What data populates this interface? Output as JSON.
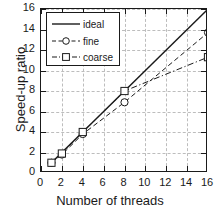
{
  "chart_data": {
    "type": "line",
    "title": "",
    "xlabel": "Number of threads",
    "ylabel": "Speed-up ratio",
    "xlim": [
      0,
      16
    ],
    "ylim": [
      0,
      16
    ],
    "xticks": [
      0,
      2,
      4,
      6,
      8,
      10,
      12,
      14,
      16
    ],
    "yticks": [
      0,
      2,
      4,
      6,
      8,
      10,
      12,
      14,
      16
    ],
    "grid": true,
    "legend_position": "upper-left",
    "series": [
      {
        "name": "ideal",
        "linestyle": "solid",
        "marker": "none",
        "color": "#1a1a1a",
        "x": [
          1,
          16
        ],
        "y": [
          1,
          16
        ]
      },
      {
        "name": "fine",
        "linestyle": "dashed",
        "marker": "circle",
        "color": "#1a1a1a",
        "x": [
          1,
          2,
          4,
          8,
          16
        ],
        "y": [
          1.0,
          1.8,
          3.8,
          6.9,
          13.7
        ]
      },
      {
        "name": "coarse",
        "linestyle": "dashdot",
        "marker": "square",
        "color": "#1a1a1a",
        "x": [
          1,
          2,
          4,
          8,
          16
        ],
        "y": [
          1.0,
          1.9,
          4.0,
          8.0,
          11.3
        ]
      }
    ]
  },
  "axes": {
    "x_title": "Number of threads",
    "y_title": "Speed-up ratio",
    "x_tick_labels": [
      "0",
      "2",
      "4",
      "6",
      "8",
      "10",
      "12",
      "14",
      "16"
    ],
    "y_tick_labels": [
      "0",
      "2",
      "4",
      "6",
      "8",
      "10",
      "12",
      "14",
      "16"
    ]
  },
  "legend": {
    "entries": [
      {
        "label": "ideal"
      },
      {
        "label": "fine"
      },
      {
        "label": "coarse"
      }
    ]
  },
  "colors": {
    "line": "#1a1a1a",
    "grid": "#bdbdbd",
    "frame": "#1a1a1a",
    "background": "#ffffff"
  }
}
